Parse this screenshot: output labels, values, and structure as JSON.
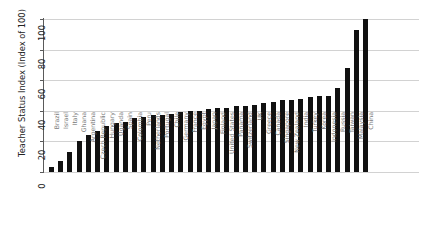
{
  "chart_data": {
    "type": "bar",
    "title": "",
    "xlabel": "",
    "ylabel": "Teacher Status Index (Index of 100)",
    "ylim": [
      0,
      100
    ],
    "yticks": [
      0,
      20,
      40,
      60,
      80,
      100
    ],
    "grid": true,
    "legend": "none",
    "bar_color": "#111111",
    "gridline_color": "#d2d2d2",
    "axis_color": "#5a5a5a",
    "xtick_label_color": "#7a7a7a",
    "categories": [
      "Brazil",
      "Israel",
      "Italy",
      "Ghana",
      "Argentina",
      "Czech Republic",
      "Hungary",
      "Uganda",
      "Spain",
      "Colombia",
      "Peru",
      "Netherlands",
      "Portugal",
      "Chile",
      "Germany",
      "France",
      "Egypt",
      "Japan",
      "Finland",
      "United States",
      "Panama",
      "Switzerland",
      "UK",
      "Greece",
      "Canada",
      "Singapore",
      "New Zealand",
      "India",
      "Turkey",
      "Korea",
      "Indonesia",
      "Russia",
      "Taiwan",
      "Malaysia",
      "China"
    ],
    "values": [
      3,
      7,
      13,
      20,
      24,
      27,
      30,
      32,
      33,
      35,
      36,
      37,
      37,
      38,
      39,
      40,
      40,
      41,
      42,
      42,
      43,
      43,
      44,
      45,
      46,
      47,
      47,
      48,
      49,
      50,
      50,
      55,
      68,
      93,
      100
    ]
  }
}
